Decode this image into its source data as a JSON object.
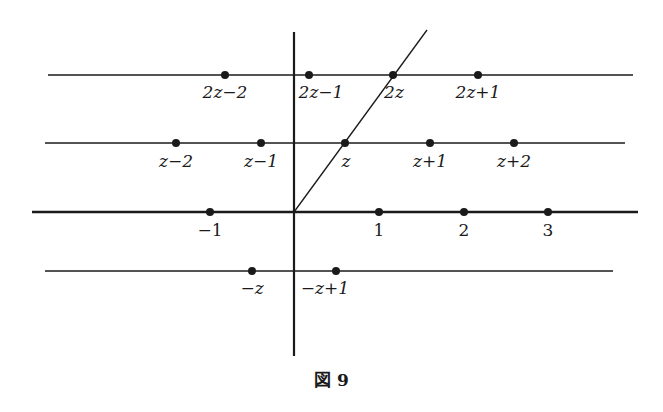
{
  "figure": {
    "caption": "図 9",
    "colors": {
      "ink": "#1a1a1a",
      "background": "#ffffff"
    }
  },
  "axes": {
    "origin": [
      294,
      212
    ],
    "vertical": {
      "x": 294,
      "y1": 32,
      "y2": 356
    },
    "real_axis": {
      "y": 212,
      "x1": 32,
      "x2": 638,
      "label": "real axis"
    }
  },
  "lines": [
    {
      "id": "row-2z",
      "y": 75,
      "x1": 48,
      "x2": 633
    },
    {
      "id": "row-z",
      "y": 143,
      "x1": 45,
      "x2": 625
    },
    {
      "id": "row-neg-z",
      "y": 271,
      "x1": 45,
      "x2": 613
    }
  ],
  "diagonal": {
    "x1": 294,
    "y1": 212,
    "x2": 427,
    "y2": 30,
    "label": "line through 0, z, 2z"
  },
  "points": [
    {
      "label": "2z−2",
      "x": 225,
      "y": 75
    },
    {
      "label": "2z−1",
      "x": 309,
      "y": 75
    },
    {
      "label": "2z",
      "x": 393,
      "y": 75
    },
    {
      "label": "2z+1",
      "x": 478,
      "y": 75
    },
    {
      "label": "z−2",
      "x": 176,
      "y": 143
    },
    {
      "label": "z−1",
      "x": 261,
      "y": 143
    },
    {
      "label": "z",
      "x": 345,
      "y": 143
    },
    {
      "label": "z+1",
      "x": 430,
      "y": 143
    },
    {
      "label": "z+2",
      "x": 514,
      "y": 143
    },
    {
      "label": "−1",
      "x": 210,
      "y": 212
    },
    {
      "label": "1",
      "x": 379,
      "y": 212
    },
    {
      "label": "2",
      "x": 464,
      "y": 212
    },
    {
      "label": "3",
      "x": 548,
      "y": 212
    },
    {
      "label": "−z",
      "x": 252,
      "y": 271
    },
    {
      "label": "−z+1",
      "x": 336,
      "y": 271
    }
  ],
  "labels": {
    "p_2z_m2": "2z−2",
    "p_2z_m1": "2z−1",
    "p_2z": "2z",
    "p_2z_p1": "2z+1",
    "p_z_m2": "z−2",
    "p_z_m1": "z−1",
    "p_z": "z",
    "p_z_p1": "z+1",
    "p_z_p2": "z+2",
    "p_m1": "−1",
    "p_1": "1",
    "p_2": "2",
    "p_3": "3",
    "p_mz": "−z",
    "p_mz_p1": "−z+1"
  }
}
